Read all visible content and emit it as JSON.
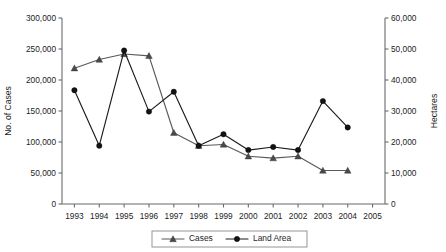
{
  "chart_data": {
    "type": "line",
    "title": "",
    "xlabel": "",
    "ylabel": "No. of Cases",
    "y2label": "Hectares",
    "categories": [
      "1993",
      "1994",
      "1995",
      "1996",
      "1997",
      "1998",
      "1999",
      "2000",
      "2001",
      "2002",
      "2003",
      "2004",
      "2005"
    ],
    "ylim": [
      0,
      300000
    ],
    "y2lim": [
      0,
      60000
    ],
    "yticks": [
      "0",
      "50,000",
      "100,000",
      "150,000",
      "200,000",
      "250,000",
      "300,000"
    ],
    "ytick_values": [
      0,
      50000,
      100000,
      150000,
      200000,
      250000,
      300000
    ],
    "y2ticks": [
      "0",
      "10,000",
      "20,000",
      "30,000",
      "40,000",
      "50,000",
      "60,000"
    ],
    "y2tick_values": [
      0,
      10000,
      20000,
      30000,
      40000,
      50000,
      60000
    ],
    "grid": false,
    "legend_position": "bottom",
    "series": [
      {
        "name": "Cases",
        "axis": "left",
        "marker": "triangle",
        "color": "#4a4a4a",
        "values": [
          219000,
          233000,
          242000,
          239000,
          115000,
          94000,
          96000,
          77000,
          74000,
          77000,
          54000,
          54000,
          null
        ]
      },
      {
        "name": "Land Area",
        "axis": "right",
        "marker": "circle",
        "color": "#131313",
        "values": [
          36700,
          18800,
          49500,
          29800,
          36200,
          18800,
          22500,
          17400,
          18400,
          17400,
          33200,
          24700,
          null
        ]
      }
    ]
  },
  "legend": {
    "items": [
      {
        "label": "Cases",
        "marker": "triangle"
      },
      {
        "label": "Land Area",
        "marker": "circle"
      }
    ]
  }
}
